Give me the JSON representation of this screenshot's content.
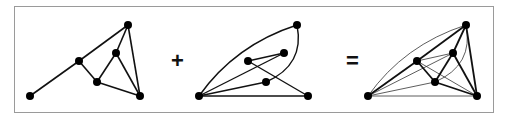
{
  "figure": {
    "operators": {
      "plus": "+",
      "equals": "="
    },
    "graphs": [
      {
        "id": "graph-1",
        "nodes": {
          "A": [
            30,
            96
          ],
          "B": [
            79,
            61
          ],
          "C": [
            128,
            25
          ],
          "D": [
            116,
            53
          ],
          "E": [
            97,
            82
          ],
          "F": [
            140,
            96
          ]
        },
        "edges": [
          [
            "A",
            "B"
          ],
          [
            "B",
            "C"
          ],
          [
            "C",
            "D"
          ],
          [
            "C",
            "F"
          ],
          [
            "B",
            "E"
          ],
          [
            "E",
            "D"
          ],
          [
            "D",
            "F"
          ],
          [
            "E",
            "F"
          ]
        ]
      },
      {
        "id": "graph-2",
        "nodes": {
          "A": [
            199,
            96
          ],
          "B": [
            248,
            61
          ],
          "C": [
            297,
            25
          ],
          "D": [
            284,
            53
          ],
          "E": [
            266,
            82
          ],
          "F": [
            308,
            96
          ]
        },
        "edges": [
          [
            "A",
            "D"
          ],
          [
            "A",
            "E"
          ],
          [
            "A",
            "F"
          ],
          [
            "B",
            "D"
          ],
          [
            "B",
            "F"
          ]
        ],
        "curved_edges": [
          [
            "A",
            "C"
          ],
          [
            "C",
            "E"
          ]
        ]
      },
      {
        "id": "graph-union",
        "nodes": {
          "A": [
            368,
            96
          ],
          "B": [
            417,
            61
          ],
          "C": [
            466,
            25
          ],
          "D": [
            453,
            53
          ],
          "E": [
            435,
            82
          ],
          "F": [
            477,
            96
          ]
        }
      }
    ],
    "colors": {
      "edge": "#111111",
      "node": "#000000",
      "frame": "#9a9a9a"
    }
  }
}
